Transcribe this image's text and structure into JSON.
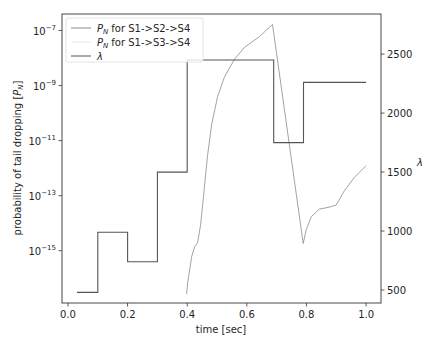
{
  "chart_data": {
    "type": "line",
    "title": "",
    "xlabel": "time [sec]",
    "ylabel": "probability of tail dropping [P_N]",
    "ylabel_right": "λ",
    "xlim": [
      -0.02,
      1.05
    ],
    "ylim_log10": [
      -16.9,
      -6.4
    ],
    "ylim_right": [
      390,
      2840
    ],
    "grid": false,
    "legend_position": "top-left",
    "x_ticks": [
      0.0,
      0.2,
      0.4,
      0.6,
      0.8,
      1.0
    ],
    "x_tick_labels": [
      "0.0",
      "0.2",
      "0.4",
      "0.6",
      "0.8",
      "1.0"
    ],
    "y_ticks_log10": [
      -7,
      -9,
      -11,
      -13,
      -15
    ],
    "y_tick_labels": [
      {
        "base": "10",
        "exp": "−7"
      },
      {
        "base": "10",
        "exp": "−9"
      },
      {
        "base": "10",
        "exp": "−11"
      },
      {
        "base": "10",
        "exp": "−13"
      },
      {
        "base": "10",
        "exp": "−15"
      }
    ],
    "y_right_ticks": [
      500,
      1000,
      1500,
      2000,
      2500
    ],
    "y_right_tick_labels": [
      "500",
      "1000",
      "1500",
      "2000",
      "2500"
    ],
    "series": [
      {
        "name": "P_N for S1->S2->S4",
        "legend_label": "for S1->S2->S4",
        "axis": "left",
        "color": "#8c8c8c",
        "x": [
          0.398,
          0.401,
          0.415,
          0.425,
          0.435,
          0.445,
          0.455,
          0.468,
          0.482,
          0.502,
          0.525,
          0.559,
          0.592,
          0.642,
          0.686,
          0.789,
          0.799,
          0.816,
          0.843,
          0.876,
          0.9,
          0.926,
          0.96,
          1.0
        ],
        "log10_y": [
          -16.57,
          -16.21,
          -15.21,
          -14.85,
          -14.71,
          -14.06,
          -12.99,
          -11.55,
          -10.41,
          -9.4,
          -8.68,
          -8.04,
          -7.61,
          -7.22,
          -6.78,
          -14.74,
          -14.24,
          -13.77,
          -13.49,
          -13.42,
          -13.34,
          -12.84,
          -12.34,
          -11.91
        ]
      },
      {
        "name": "P_N for S1->S3->S4",
        "legend_label": "for S1->S3->S4",
        "axis": "left",
        "color": "#e8e8e8",
        "x": [],
        "log10_y": []
      },
      {
        "name": "λ",
        "legend_label": "λ",
        "axis": "right",
        "color": "#555555",
        "x": [
          0.03,
          0.1,
          0.1,
          0.2,
          0.2,
          0.3,
          0.3,
          0.4,
          0.4,
          0.69,
          0.69,
          0.79,
          0.79,
          1.0
        ],
        "y": [
          480,
          480,
          990,
          990,
          740,
          740,
          1500,
          1500,
          2450,
          2450,
          1750,
          1750,
          2260,
          2260
        ]
      }
    ]
  }
}
